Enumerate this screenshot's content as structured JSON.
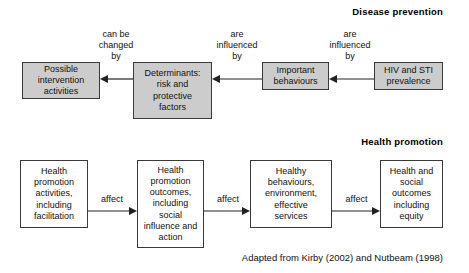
{
  "figure": {
    "caption": "Adapted from Kirby (2002) and Nutbeam (1998)"
  },
  "sections": {
    "disease_prevention": {
      "title": "Disease  prevention",
      "flow_direction": "right-to-left",
      "boxes": [
        {
          "id": "possible-intervention-activities",
          "label": "Possible\nintervention\nactivities"
        },
        {
          "id": "determinants",
          "label": "Determinants:\nrisk and\nprotective\nfactors"
        },
        {
          "id": "important-behaviours",
          "label": "Important\nbehaviours"
        },
        {
          "id": "hiv-sti-prevalence",
          "label": "HIV and STI\nprevalence"
        }
      ],
      "edges": [
        {
          "id": "can-be-changed-by",
          "label": "can be\nchanged\nby"
        },
        {
          "id": "are-influenced-by-1",
          "label": "are\ninfluenced\nby"
        },
        {
          "id": "are-influenced-by-2",
          "label": "are\ninfluenced\nby"
        }
      ]
    },
    "health_promotion": {
      "title": "Health promotion",
      "flow_direction": "left-to-right",
      "boxes": [
        {
          "id": "health-promotion-activities",
          "label": "Health\npromotion\nactivities,\nincluding\nfacilitation"
        },
        {
          "id": "health-promotion-outcomes",
          "label": "Health\npromotion\noutcomes,\nincluding\nsocial\ninfluence and\naction"
        },
        {
          "id": "healthy-behaviours",
          "label": "Healthy\nbehaviours,\nenvironment,\neffective\nservices"
        },
        {
          "id": "health-social-outcomes",
          "label": "Health and\nsocial\noutcomes\nincluding\nequity"
        }
      ],
      "edges": [
        {
          "id": "affect-1",
          "label": "affect"
        },
        {
          "id": "affect-2",
          "label": "affect"
        },
        {
          "id": "affect-3",
          "label": "affect"
        }
      ]
    }
  },
  "colors": {
    "box_fill_grey": "#cccccc",
    "box_fill_white": "#ffffff",
    "box_border": "#3a3a3a",
    "text": "#111111",
    "background": "#ffffff"
  }
}
